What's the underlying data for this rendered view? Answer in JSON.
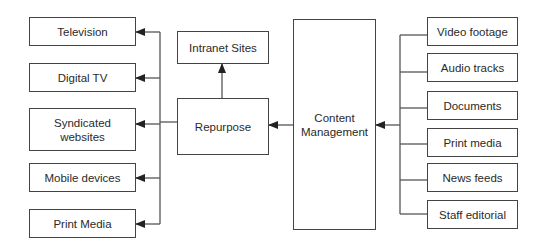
{
  "diagram": {
    "center": {
      "label": "Content Management"
    },
    "repurpose": {
      "label": "Repurpose"
    },
    "intranet": {
      "label": "Intranet Sites"
    },
    "outputs": [
      {
        "label": "Television"
      },
      {
        "label": "Digital TV"
      },
      {
        "label": "Syndicated websites"
      },
      {
        "label": "Mobile devices"
      },
      {
        "label": "Print Media"
      }
    ],
    "sources": [
      {
        "label": "Video footage"
      },
      {
        "label": "Audio tracks"
      },
      {
        "label": "Documents"
      },
      {
        "label": "Print media"
      },
      {
        "label": "News feeds"
      },
      {
        "label": "Staff editorial"
      }
    ],
    "colors": {
      "line": "#444444",
      "background": "#ffffff"
    }
  }
}
